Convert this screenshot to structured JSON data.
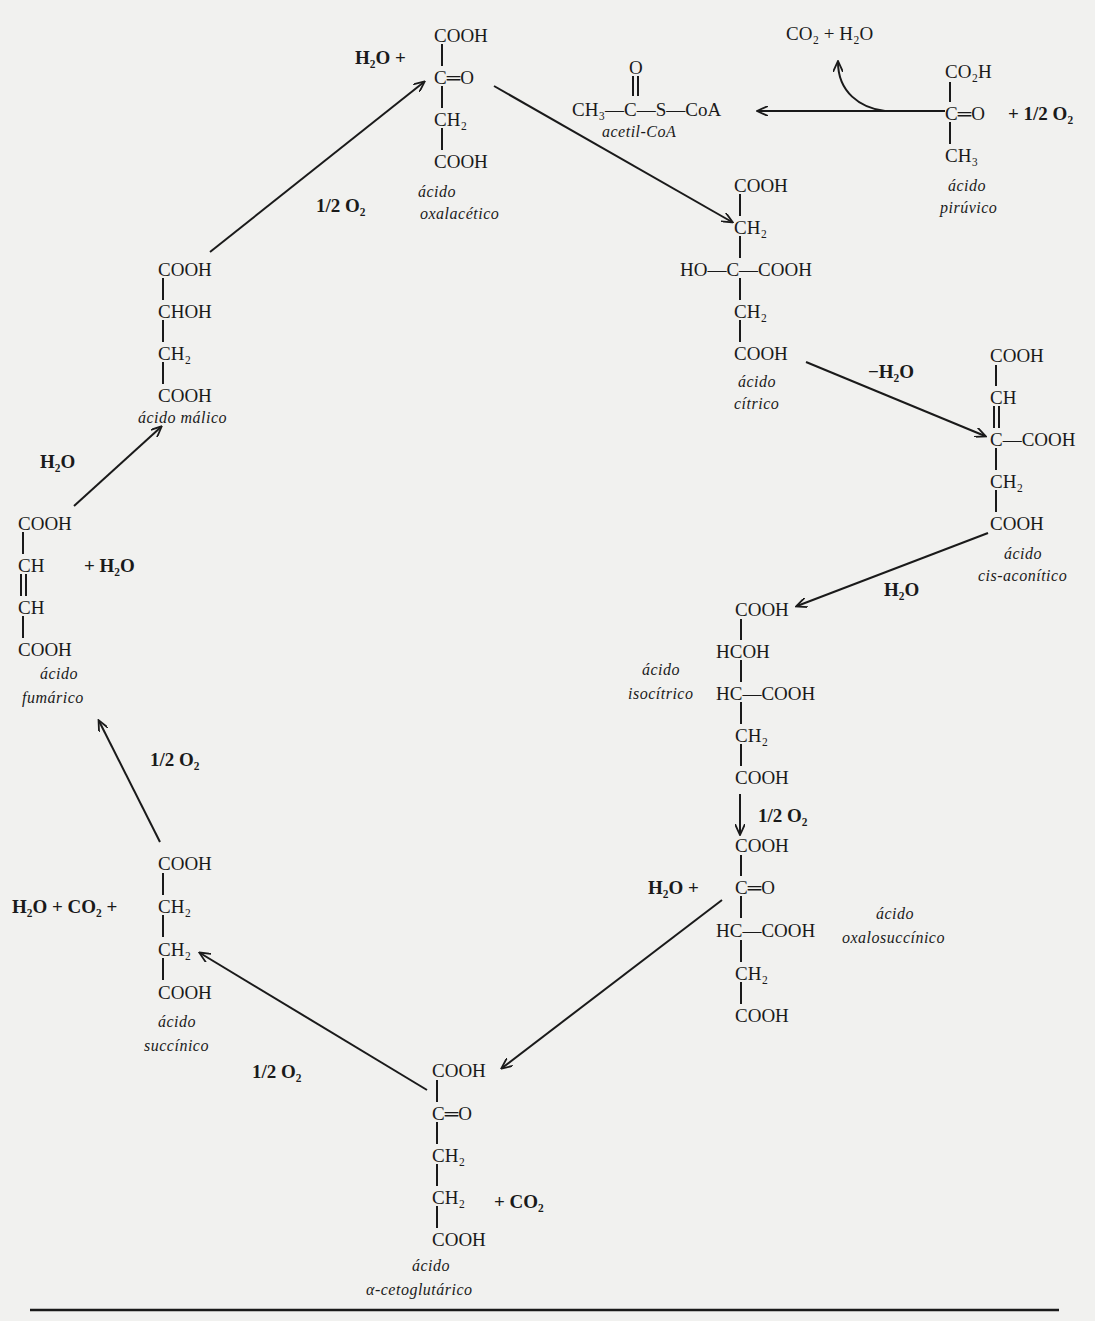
{
  "diagram": {
    "nodes": {
      "oxalacetico": {
        "name_1": "ácido",
        "name_2": "oxalacético",
        "lines": [
          "COOH",
          "C═O",
          "CH₂",
          "COOH"
        ],
        "reactant": "H₂O +"
      },
      "acetil_coa": {
        "formula_top": "O",
        "formula": "CH₃—C—S—CoA",
        "name": "acetil-CoA"
      },
      "piruvico": {
        "name_1": "ácido",
        "name_2": "pirúvico",
        "lines": [
          "CO₂H",
          "C═O",
          "CH₃"
        ],
        "reactant": "+ 1/2 O₂",
        "byproduct": "CO₂ + H₂O"
      },
      "citrico": {
        "name_1": "ácido",
        "name_2": "cítrico",
        "lines": [
          "COOH",
          "CH₂",
          "HO—C—COOH",
          "CH₂",
          "COOH"
        ]
      },
      "cis_aconitico": {
        "name_1": "ácido",
        "name_2": "cis-aconítico",
        "lines": [
          "COOH",
          "CH",
          "C—COOH",
          "CH₂",
          "COOH"
        ]
      },
      "isocitrico": {
        "name_1": "ácido",
        "name_2": "isocítrico",
        "lines": [
          "COOH",
          "HCOH",
          "HC—COOH",
          "CH₂",
          "COOH"
        ]
      },
      "oxalosuccinico": {
        "name_1": "ácido",
        "name_2": "oxalosuccínico",
        "lines": [
          "COOH",
          "C═O",
          "HC—COOH",
          "CH₂",
          "COOH"
        ],
        "reactant": "H₂O +"
      },
      "cetoglutarico": {
        "name_1": "ácido",
        "name_2": "α-cetoglutárico",
        "lines": [
          "COOH",
          "C═O",
          "CH₂",
          "CH₂",
          "COOH"
        ],
        "product": "+ CO₂"
      },
      "succinico": {
        "name_1": "ácido",
        "name_2": "succínico",
        "lines": [
          "COOH",
          "CH₂",
          "CH₂",
          "COOH"
        ],
        "reactant": "H₂O + CO₂ +"
      },
      "fumarico": {
        "name_1": "ácido",
        "name_2": "fumárico",
        "lines": [
          "COOH",
          "CH",
          "CH",
          "COOH"
        ],
        "reactant": "+ H₂O"
      },
      "malico": {
        "name": "ácido málico",
        "lines": [
          "COOH",
          "CHOH",
          "CH₂",
          "COOH"
        ]
      }
    },
    "arrow_labels": {
      "malico_to_oxalacetico": "1/2 O₂",
      "citrico_to_cis_aconitico": "−H₂O",
      "cis_aconitico_to_isocitrico": "H₂O",
      "isocitrico_to_oxalosuccinico": "1/2 O₂",
      "cetoglutarico_to_succinico": "1/2 O₂",
      "succinico_to_fumarico": "1/2 O₂",
      "fumarico_to_malico": "H₂O"
    }
  }
}
